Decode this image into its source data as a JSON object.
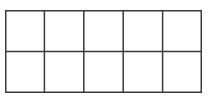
{
  "diagram": {
    "type": "ten-frame",
    "rows": 2,
    "columns": 5,
    "cells": [
      {
        "row": 0,
        "col": 0,
        "filled": false
      },
      {
        "row": 0,
        "col": 1,
        "filled": false
      },
      {
        "row": 0,
        "col": 2,
        "filled": false
      },
      {
        "row": 0,
        "col": 3,
        "filled": false
      },
      {
        "row": 0,
        "col": 4,
        "filled": false
      },
      {
        "row": 1,
        "col": 0,
        "filled": false
      },
      {
        "row": 1,
        "col": 1,
        "filled": false
      },
      {
        "row": 1,
        "col": 2,
        "filled": false
      },
      {
        "row": 1,
        "col": 3,
        "filled": false
      },
      {
        "row": 1,
        "col": 4,
        "filled": false
      }
    ],
    "colors": {
      "line": "#3a3a3a",
      "background": "#ffffff"
    }
  }
}
